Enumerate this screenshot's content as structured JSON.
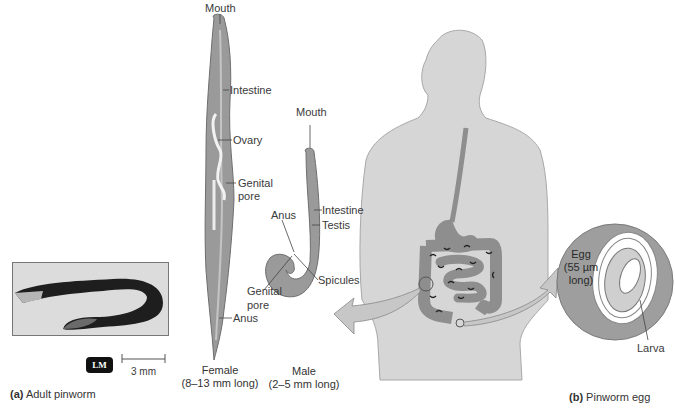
{
  "figure": {
    "panel_a": {
      "letter": "(a)",
      "title": "Adult pinworm",
      "micrograph_badge": "LM",
      "scale_bar": "3 mm"
    },
    "female": {
      "labels": [
        "Mouth",
        "Intestine",
        "Ovary",
        "Genital",
        "pore",
        "Anus"
      ],
      "caption_line1": "Female",
      "caption_line2": "(8–13 mm long)"
    },
    "male": {
      "labels": [
        "Mouth",
        "Intestine",
        "Testis",
        "Anus",
        "Spicules",
        "Genital",
        "pore"
      ],
      "caption_line1": "Male",
      "caption_line2": "(2–5 mm long)"
    },
    "panel_b": {
      "letter": "(b)",
      "title": "Pinworm egg",
      "egg_label_1": "Egg",
      "egg_label_2": "(55 µm",
      "egg_label_3": "long)",
      "larva_label": "Larva"
    },
    "colors": {
      "body_gray": "#d4d4d4",
      "organ_gray": "#8f8f8f",
      "worm_gray": "#9a9a9a",
      "text": "#333333"
    }
  }
}
